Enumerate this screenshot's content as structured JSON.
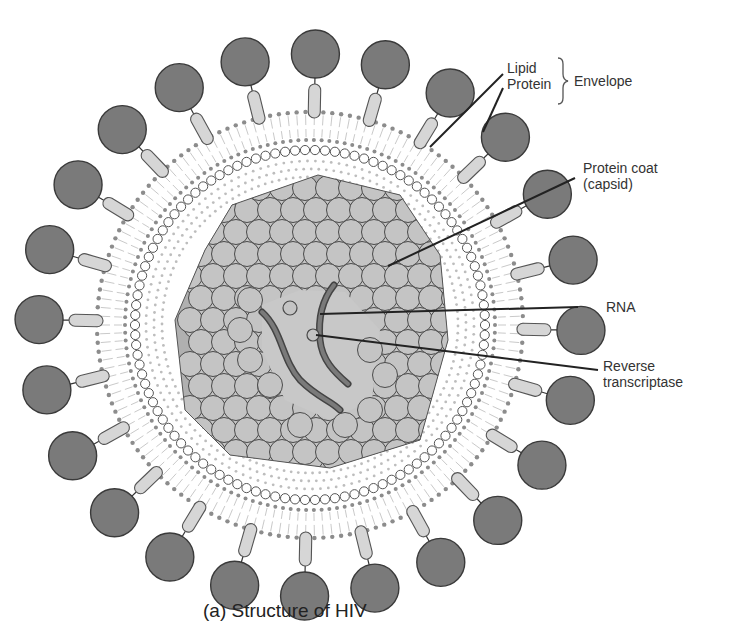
{
  "figure": {
    "caption": "(a)  Structure of HIV",
    "colors": {
      "knob": "#7a7a7a",
      "knob_stroke": "#3a3a3a",
      "stalk": "#d6d6d6",
      "lipid_head": "#8c8c8c",
      "matrix_ring": "#ffffff",
      "capsid": "#c4c4c4",
      "capsid_stroke": "#4a4a4a",
      "rna": "#6a6a6a",
      "leader": "#222222"
    }
  },
  "labels": {
    "lipid": "Lipid",
    "protein": "Protein",
    "envelope": "Envelope",
    "protein_coat_line1": "Protein coat",
    "protein_coat_line2": "(capsid)",
    "rna": "RNA",
    "reverse_line1": "Reverse",
    "reverse_line2": "transcriptase"
  }
}
